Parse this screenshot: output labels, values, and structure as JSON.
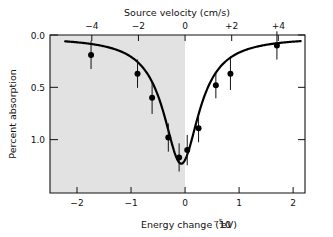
{
  "figure": {
    "background_color": "#ffffff",
    "shaded_region_color": "#e2e2e2",
    "curve_color": "#000000",
    "marker_color": "#000000",
    "axis_color": "#111111"
  },
  "axes": {
    "top": {
      "title": "Source velocity (cm/s)",
      "tick_labels": [
        "−4",
        "−2",
        "0",
        "+2",
        "+4"
      ],
      "tick_values": [
        -4,
        -2,
        0,
        2,
        4
      ],
      "range": [
        -5.9,
        5.0
      ]
    },
    "bottom": {
      "title": "Energy change (10−5 eV)",
      "title_base": "Energy change (10",
      "title_exponent": "−5",
      "title_tail": " eV)",
      "tick_labels": [
        "−2",
        "−1",
        "0",
        "1",
        "2"
      ],
      "tick_values": [
        -2,
        -1,
        0,
        1,
        2
      ],
      "range": [
        -2.5,
        2.22
      ]
    },
    "left": {
      "title": "Percent absorption",
      "tick_labels": [
        "0.0",
        "0.5",
        "1.0"
      ],
      "tick_values": [
        0.0,
        0.5,
        1.0
      ],
      "range": [
        0.0,
        1.51
      ]
    }
  },
  "chart_data": {
    "type": "scatter",
    "title": "",
    "subtitle": "",
    "xlabel": "Energy change (10−5 eV)",
    "ylabel": "Percent absorption",
    "xlabel_secondary": "Source velocity (cm/s)",
    "xlim": [
      -2.5,
      2.22
    ],
    "ylim": [
      0.0,
      1.51
    ],
    "y_inverted": true,
    "grid": false,
    "legend": null,
    "shaded_region": {
      "x_from": -2.5,
      "x_to": 0.0,
      "color": "#e2e2e2"
    },
    "x_tick_labels": [
      "−2",
      "−1",
      "0",
      "1",
      "2"
    ],
    "x_ticks": [
      -2,
      -1,
      0,
      1,
      2
    ],
    "x_ticks_top": [
      -4,
      -2,
      0,
      2,
      4
    ],
    "x_tick_labels_top": [
      "−4",
      "−2",
      "0",
      "+2",
      "+4"
    ],
    "y_ticks": [
      0.0,
      0.5,
      1.0
    ],
    "y_tick_labels": [
      "0.0",
      "0.5",
      "1.0"
    ],
    "points": [
      {
        "x": -1.74,
        "y": 0.19,
        "yerr": 0.135
      },
      {
        "x": -0.88,
        "y": 0.37,
        "yerr": 0.135
      },
      {
        "x": -0.61,
        "y": 0.6,
        "yerr": 0.155
      },
      {
        "x": -0.31,
        "y": 0.98,
        "yerr": 0.135
      },
      {
        "x": -0.11,
        "y": 1.17,
        "yerr": 0.135
      },
      {
        "x": 0.04,
        "y": 1.1,
        "yerr": 0.145
      },
      {
        "x": 0.25,
        "y": 0.89,
        "yerr": 0.135
      },
      {
        "x": 0.57,
        "y": 0.48,
        "yerr": 0.125
      },
      {
        "x": 0.84,
        "y": 0.37,
        "yerr": 0.155
      },
      {
        "x": 1.7,
        "y": 0.1,
        "yerr": 0.135
      }
    ],
    "fit_curve": {
      "description": "Lorentzian absorption dip",
      "center": -0.07,
      "depth": 1.21,
      "half_width": 0.4,
      "baseline": 0.02
    }
  }
}
